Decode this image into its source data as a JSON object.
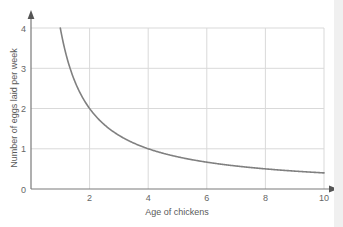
{
  "chart_data": {
    "type": "line",
    "title": "",
    "xlabel": "Age of chickens",
    "ylabel": "Number of eggs laid per week",
    "xlim": [
      0,
      10
    ],
    "ylim": [
      0,
      4
    ],
    "xticks": [
      2,
      4,
      6,
      8,
      10
    ],
    "yticks": [
      0,
      1,
      2,
      3,
      4
    ],
    "grid": true,
    "legend": false,
    "series": [
      {
        "name": "eggs laid per week",
        "color": "#808080",
        "relation": "y = 4 / x",
        "x": [
          1,
          1.25,
          1.5,
          1.75,
          2,
          2.25,
          2.5,
          2.75,
          3,
          3.5,
          4,
          4.5,
          5,
          5.5,
          6,
          6.5,
          7,
          7.5,
          8,
          8.5,
          9,
          9.5,
          10
        ],
        "y": [
          4,
          3.2,
          2.67,
          2.29,
          2,
          1.78,
          1.6,
          1.45,
          1.33,
          1.14,
          1,
          0.89,
          0.8,
          0.73,
          0.67,
          0.62,
          0.57,
          0.53,
          0.5,
          0.47,
          0.44,
          0.42,
          0.4
        ]
      }
    ]
  },
  "axes": {
    "x_tick_labels": [
      "2",
      "4",
      "6",
      "8",
      "10"
    ],
    "y_tick_labels": [
      "0",
      "1",
      "2",
      "3",
      "4"
    ],
    "origin_label": "0",
    "x_axis_title": "Age of chickens",
    "y_axis_title": "Number of eggs laid per week"
  },
  "colors": {
    "curve": "#808080",
    "grid": "#d9d9d9",
    "axis": "#7a7a7a",
    "text": "#666666",
    "background": "#ffffff",
    "margin": "#f0f0f0"
  }
}
